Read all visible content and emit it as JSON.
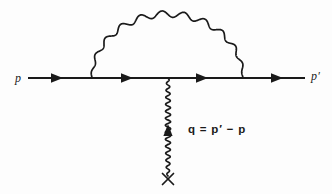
{
  "figure": {
    "kind": "feynman-diagram",
    "background_color": "#fdfdfd",
    "ink_color": "#1a1a1a",
    "width": 332,
    "height": 194
  },
  "labels": {
    "incoming_momentum": "p",
    "outgoing_momentum": "p′",
    "momentum_transfer_equation": "q = p′ − p"
  },
  "chart_data": {
    "type": "diagram",
    "title": "",
    "fermion_line": {
      "name": "fermion-line",
      "style": "straight-solid",
      "y": 78,
      "x_start": 28,
      "x_end": 305,
      "arrow_direction": "right",
      "arrow_positions_x": [
        57,
        127,
        202,
        277
      ]
    },
    "photon_loop": {
      "name": "photon-loop-arc",
      "style": "wavy-semicircle",
      "x_left_vertex": 92,
      "x_right_vertex": 243,
      "apex_y": 14,
      "baseline_y": 78,
      "wave_cycles": 11,
      "wave_amplitude": 3.2
    },
    "external_photon": {
      "name": "external-photon-line",
      "style": "wavy-vertical",
      "x": 168,
      "y_top": 78,
      "y_bottom": 176,
      "arrow_y": 129,
      "arrow_direction": "up",
      "wave_cycles": 14,
      "wave_amplitude": 2.6,
      "terminator": "cross",
      "terminator_y": 179
    },
    "vertices": [
      {
        "name": "photon-emission-vertex-left",
        "x": 92,
        "y": 78
      },
      {
        "name": "external-photon-vertex",
        "x": 168,
        "y": 78
      },
      {
        "name": "photon-absorption-vertex-right",
        "x": 243,
        "y": 78
      }
    ]
  }
}
